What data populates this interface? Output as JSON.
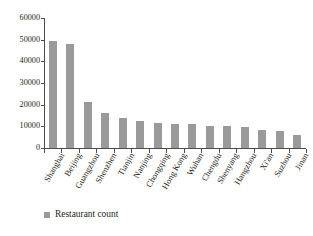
{
  "chart_data": {
    "type": "bar",
    "title": "",
    "subtitle": "",
    "xlabel": "",
    "ylabel": "",
    "grid": false,
    "legend_position": "bottom-left",
    "ylim": [
      0,
      60000
    ],
    "ytick_labels": [
      "0",
      "10000",
      "20000",
      "30000",
      "40000",
      "50000",
      "60000"
    ],
    "ytick_values": [
      0,
      10000,
      20000,
      30000,
      40000,
      50000,
      60000
    ],
    "categories": [
      "Shanghai",
      "Beijing",
      "Guangzhou",
      "Shenzhen",
      "Tianjin",
      "Nanjing",
      "Chongqing",
      "Hong Kong",
      "Wuhan",
      "Chengdu",
      "Shenyang",
      "Hangzhou",
      "Xi'an",
      "Suzhou",
      "Jinan"
    ],
    "series": [
      {
        "name": "Restaurant count",
        "color": "#9a9a9a",
        "values": [
          49500,
          47800,
          21200,
          16100,
          13900,
          12500,
          11500,
          11300,
          10900,
          10300,
          10000,
          9600,
          8200,
          7800,
          6200
        ]
      }
    ]
  },
  "legend": {
    "label": "Restaurant count",
    "swatch_color": "#9a9a9a"
  },
  "axis": {
    "line_color": "#4d4d4d"
  }
}
